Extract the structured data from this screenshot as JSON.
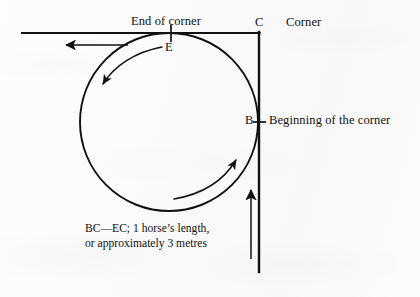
{
  "figure": {
    "background_color": "#fbfbfb",
    "ink_color": "#111111"
  },
  "labels": {
    "end_of_corner": "End of corner",
    "corner_point": "C",
    "corner": "Corner",
    "end_point": "E",
    "beginning_point": "B",
    "beginning_of_the_corner": "Beginning of the corner"
  },
  "caption": {
    "line1": "BC—EC; 1 horse’s length,",
    "line2": "or approximately 3 metres"
  },
  "geometry": {
    "corner_x": 259,
    "corner_y": 33,
    "horizontal_line_start_x": 22,
    "vertical_line_end_y": 272,
    "circle_center_x": 169,
    "circle_center_y": 122,
    "circle_radius": 89,
    "point_e_x": 169,
    "point_e_y": 33,
    "point_b_x": 259,
    "point_b_y": 122
  },
  "arrows": {
    "track_outgoing": "arrow-left",
    "track_incoming": "arrow-up",
    "arc_upper": "curved-arrow-down-left",
    "arc_lower": "curved-arrow-up-right"
  }
}
